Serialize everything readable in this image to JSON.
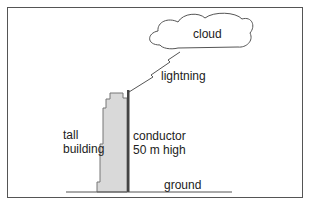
{
  "labels": {
    "cloud": "cloud",
    "lightning": "lightning",
    "building_line1": "tall",
    "building_line2": "building",
    "conductor_line1": "conductor",
    "conductor_line2": "50 m high",
    "ground": "ground"
  },
  "colors": {
    "building_fill": "#d9d9d9",
    "conductor": "#444444",
    "line": "#555555"
  }
}
